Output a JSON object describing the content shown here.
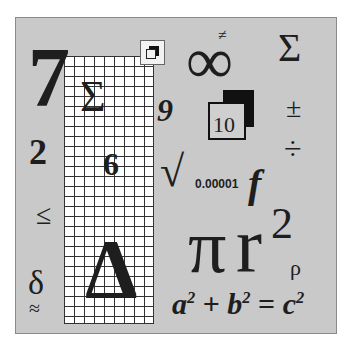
{
  "symbols": {
    "seven": "7",
    "two": "2",
    "leq": "≤",
    "delta_lower": "δ",
    "approx": "≈",
    "sigma_grid": "Σ",
    "six": "6",
    "delta_upper": "Δ",
    "nine": "9",
    "neq": "≠",
    "infinity": "∞",
    "sigma_right": "Σ",
    "plusminus": "±",
    "divide": "÷",
    "ten": "10",
    "sqrt": "√",
    "small_number": "0.00001",
    "f": "f",
    "pi": "π",
    "r": "r",
    "squared": "2",
    "rho": "ρ"
  },
  "equation": {
    "a": "a",
    "a_exp": "2",
    "plus": "+",
    "b": "b",
    "b_exp": "2",
    "equals": "=",
    "c": "c",
    "c_exp": "2"
  },
  "colors": {
    "background": "#c9c9c9",
    "ink": "#1e1e1e",
    "grid_line": "#333333"
  }
}
